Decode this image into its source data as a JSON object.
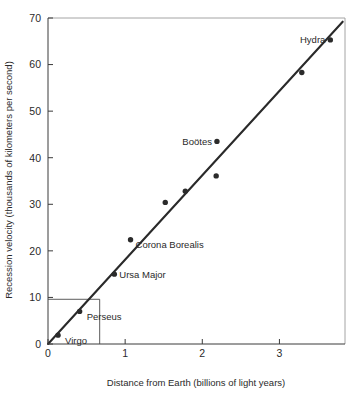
{
  "chart_data": {
    "type": "scatter",
    "title": "",
    "xlabel": "Distance from Earth (billions of light years)",
    "ylabel": "Recession velocity (thousands of kilometers per second)",
    "xlim": [
      0,
      3.85
    ],
    "ylim": [
      0,
      70
    ],
    "xticks": [
      0,
      1,
      2,
      3
    ],
    "xtick_labels": [
      "0",
      "1",
      "2",
      "3"
    ],
    "yticks": [
      0,
      10,
      20,
      30,
      40,
      50,
      60,
      70
    ],
    "ytick_labels": [
      "0",
      "10",
      "20",
      "30",
      "40",
      "50",
      "60",
      "70"
    ],
    "grid": false,
    "legend": "none",
    "points": [
      {
        "label": "Virgo",
        "x": 0.13,
        "y": 1.9,
        "label_dx": 7,
        "label_dy": 9,
        "anchor": "start"
      },
      {
        "label": "Perseus",
        "x": 0.41,
        "y": 7.0,
        "label_dx": 7,
        "label_dy": 9,
        "anchor": "start"
      },
      {
        "label": "Ursa Major",
        "x": 0.86,
        "y": 15.0,
        "label_dx": 5,
        "label_dy": 3.5,
        "anchor": "start"
      },
      {
        "label": "Corona Borealis",
        "x": 1.07,
        "y": 22.4,
        "label_dx": 5,
        "label_dy": 8,
        "anchor": "start"
      },
      {
        "label": "",
        "x": 1.52,
        "y": 30.4,
        "label_dx": 0,
        "label_dy": 0,
        "anchor": "start"
      },
      {
        "label": "",
        "x": 1.78,
        "y": 32.8,
        "label_dx": 0,
        "label_dy": 0,
        "anchor": "start"
      },
      {
        "label": "",
        "x": 2.18,
        "y": 36.1,
        "label_dx": 0,
        "label_dy": 0,
        "anchor": "start"
      },
      {
        "label": "Boötes",
        "x": 2.19,
        "y": 43.5,
        "label_dx": -5,
        "label_dy": 3.5,
        "anchor": "end"
      },
      {
        "label": "",
        "x": 3.29,
        "y": 58.3,
        "label_dx": 0,
        "label_dy": 0,
        "anchor": "start"
      },
      {
        "label": "Hydra",
        "x": 3.66,
        "y": 65.3,
        "label_dx": -5,
        "label_dy": 3.5,
        "anchor": "end"
      }
    ],
    "fit_line": {
      "x0": 0.0,
      "y0": 0.0,
      "x1": 3.82,
      "y1": 69.2
    },
    "guides": [
      {
        "type": "horizontal",
        "y": 9.6,
        "x_from": 0.0,
        "x_to": 0.67
      },
      {
        "type": "vertical",
        "x": 0.67,
        "y_from": 0.0,
        "y_to": 9.6
      }
    ],
    "point_radius": 2.7
  }
}
